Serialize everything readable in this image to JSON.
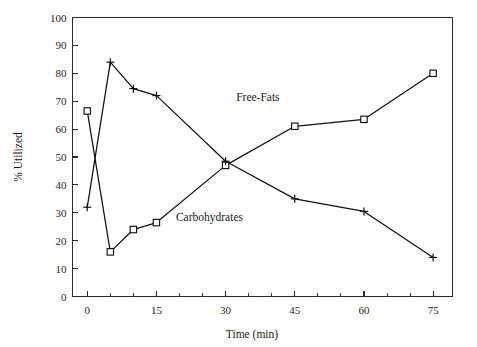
{
  "chart_data": {
    "type": "line",
    "title": "",
    "xlabel": "Time (min)",
    "ylabel": "% Utilized",
    "xlim": [
      0,
      75
    ],
    "ylim": [
      0,
      100
    ],
    "grid": false,
    "legend_position": "inline-annotation",
    "x_ticks_major": [
      0,
      15,
      30,
      45,
      60,
      75
    ],
    "x_tick_labels": [
      "0",
      "15",
      "30",
      "45",
      "60",
      "75"
    ],
    "x_ticks_minor": [
      5,
      10,
      20,
      25,
      35,
      40,
      50,
      55,
      65,
      70
    ],
    "y_ticks_major": [
      0,
      10,
      20,
      30,
      40,
      50,
      60,
      70,
      80,
      90,
      100
    ],
    "y_tick_labels": [
      "0",
      "10",
      "20",
      "30",
      "40",
      "50",
      "60",
      "70",
      "80",
      "90",
      "100"
    ],
    "x": [
      0,
      5,
      10,
      15,
      30,
      45,
      60,
      75
    ],
    "series": [
      {
        "name": "Free-Fats",
        "marker": "square",
        "values": [
          66.5,
          16,
          24,
          26.5,
          47,
          61,
          63.5,
          80
        ],
        "annotation": {
          "label": "Free-Fats",
          "x": 37,
          "y": 70
        }
      },
      {
        "name": "Carbohydrates",
        "marker": "plus",
        "values": [
          32,
          84,
          74.5,
          72,
          48.5,
          35,
          30.5,
          14
        ],
        "annotation": {
          "label": "Carbohydrates",
          "x": 26.5,
          "y": 27
        }
      }
    ]
  }
}
